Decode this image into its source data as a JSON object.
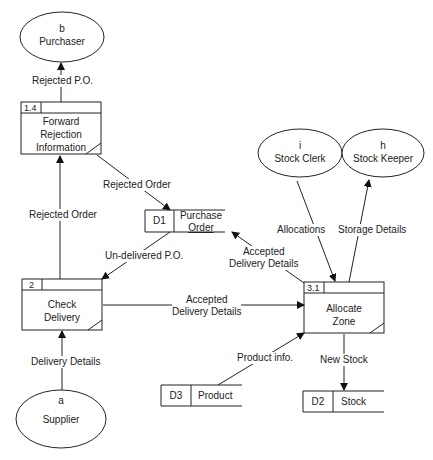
{
  "external_entities": [
    {
      "id": "b",
      "name": "Purchaser"
    },
    {
      "id": "i",
      "name": "Stock Clerk"
    },
    {
      "id": "h",
      "name": "Stock Keeper"
    },
    {
      "id": "a",
      "name": "Supplier"
    }
  ],
  "processes": [
    {
      "id": "1.4",
      "name_lines": [
        "Forward",
        "Rejection",
        "Information"
      ]
    },
    {
      "id": "2",
      "name_lines": [
        "Check",
        "Delivery"
      ]
    },
    {
      "id": "3.1",
      "name_lines": [
        "Allocate",
        "Zone"
      ]
    }
  ],
  "data_stores": [
    {
      "id": "D1",
      "name_lines": [
        "Purchase",
        "Order"
      ]
    },
    {
      "id": "D3",
      "name": "Product"
    },
    {
      "id": "D2",
      "name": "Stock"
    }
  ],
  "flows": [
    {
      "label": "Rejected P.O."
    },
    {
      "label": "Rejected Order"
    },
    {
      "label": "Rejected Order"
    },
    {
      "label": "Un-delivered P.O."
    },
    {
      "label_lines": [
        "Accepted",
        "Delivery Details"
      ]
    },
    {
      "label_lines": [
        "Accepted",
        "Delivery Details"
      ]
    },
    {
      "label": "Delivery Details"
    },
    {
      "label": "Allocations"
    },
    {
      "label": "Storage Details"
    },
    {
      "label": "Product info."
    },
    {
      "label": "New Stock"
    }
  ]
}
